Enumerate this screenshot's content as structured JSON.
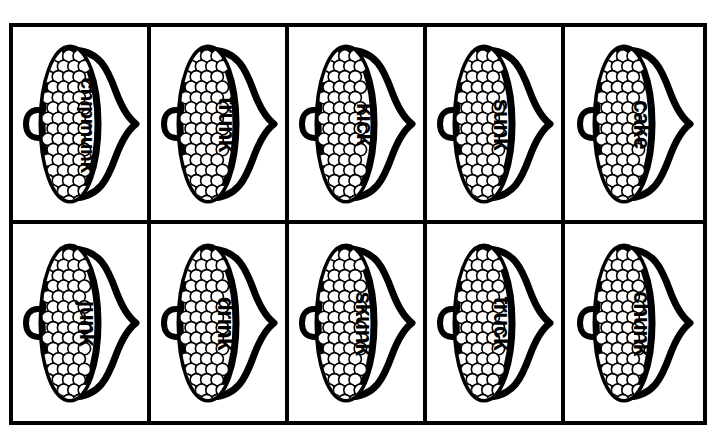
{
  "page": {
    "header_artifact": "",
    "background_color": "#ffffff",
    "ink_color": "#000000"
  },
  "sheet": {
    "rows": 2,
    "columns": 5,
    "border_color": "#000000",
    "border_width_px": 4
  },
  "cards": [
    {
      "word": "chipmunk",
      "icon": "cupcake-icon",
      "row": 1,
      "column": 1
    },
    {
      "word": "trunk",
      "icon": "cupcake-icon",
      "row": 1,
      "column": 2
    },
    {
      "word": "kick",
      "icon": "cupcake-icon",
      "row": 1,
      "column": 3
    },
    {
      "word": "sunk",
      "icon": "cupcake-icon",
      "row": 1,
      "column": 4
    },
    {
      "word": "cake",
      "icon": "cupcake-icon",
      "row": 1,
      "column": 5
    },
    {
      "word": "junk",
      "icon": "cupcake-icon",
      "row": 2,
      "column": 1
    },
    {
      "word": "drink",
      "icon": "cupcake-icon",
      "row": 2,
      "column": 2
    },
    {
      "word": "skunk",
      "icon": "cupcake-icon",
      "row": 2,
      "column": 3
    },
    {
      "word": "truck",
      "icon": "cupcake-icon",
      "row": 2,
      "column": 4
    },
    {
      "word": "chunk",
      "icon": "cupcake-icon",
      "row": 2,
      "column": 5
    }
  ]
}
